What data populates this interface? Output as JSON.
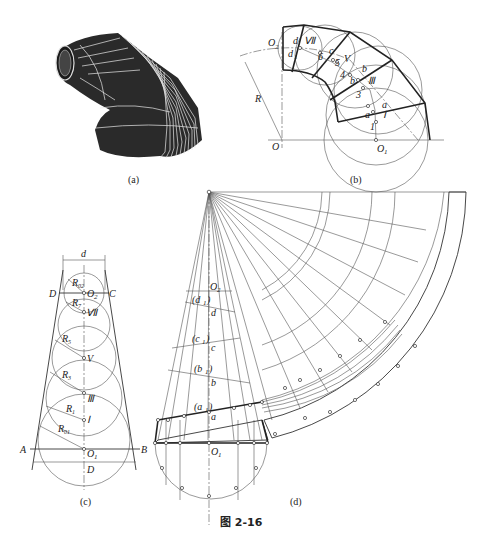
{
  "figure": {
    "title": "图 2-16",
    "panels": [
      {
        "id": "a",
        "caption": "(a)",
        "description": "3D rendering of segmented reducing elbow"
      },
      {
        "id": "b",
        "caption": "(b)",
        "description": "Elbow front view with inscribed spheres"
      },
      {
        "id": "c",
        "caption": "(c)",
        "description": "Sphere arrangement in cone"
      },
      {
        "id": "d",
        "caption": "(d)",
        "description": "Development (unfolding) of cone segments"
      }
    ]
  },
  "panel_b": {
    "labels": {
      "O2": "O",
      "O2_sub": "2",
      "O": "O",
      "O1": "O",
      "O1_sub": "1",
      "R": "R",
      "VII": "Ⅶ",
      "V": "V",
      "III": "Ⅲ",
      "I": "Ⅰ",
      "d": "d",
      "d1": "d",
      "d1_sub": "1",
      "c": "c",
      "b": "b",
      "b1": "b",
      "a": "a",
      "a1": "a",
      "n6": "6",
      "n5": "5",
      "n4": "4",
      "n3": "3",
      "n1": "1"
    }
  },
  "panel_c": {
    "labels": {
      "d": "d",
      "D_top": "D",
      "C": "C",
      "O2": "O",
      "O2_sub": "2",
      "R02": "R",
      "R02_sub": "02",
      "R7": "R",
      "R7_sub": "7",
      "VII": "Ⅶ",
      "R5": "R",
      "R5_sub": "5",
      "V": "V",
      "R3": "R",
      "R3_sub": "3",
      "III": "Ⅲ",
      "R1": "R",
      "R1_sub": "1",
      "I": "Ⅰ",
      "R01": "R",
      "R01_sub": "01",
      "A": "A",
      "B": "B",
      "O1": "O",
      "O1_sub": "1",
      "D_bottom": "D"
    }
  },
  "panel_d": {
    "labels": {
      "O2": "O",
      "O2_sub": "2",
      "d1": "(d",
      "d1_sub": "1",
      "d1_close": ")",
      "d": "d",
      "c1": "(c",
      "c1_sub": "1",
      "c1_close": ")",
      "c": "c",
      "b1": "(b",
      "b1_sub": "1",
      "b1_close": ")",
      "b": "b",
      "a1": "(a",
      "a1_sub": "1",
      "a1_close": ")",
      "a": "a",
      "O1": "O",
      "O1_sub": "1"
    }
  }
}
